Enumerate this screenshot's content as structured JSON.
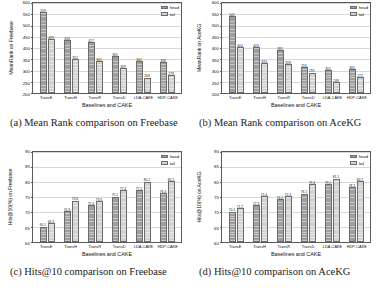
{
  "figure": {
    "shared": {
      "xlabel": "Baselines and CAKE",
      "categories": [
        "TransE",
        "TransH",
        "TransR",
        "TransD",
        "LDA-CAKE",
        "HDP-CAKE"
      ],
      "legend": [
        "head",
        "tail"
      ]
    },
    "subfigures": [
      {
        "tag": "(a)",
        "caption": "(a) Mean Rank comparison on Freebase",
        "caption_label": "(a)",
        "caption_text": "Mean Rank comparison on Freebase"
      },
      {
        "tag": "(b)",
        "caption": "(b) Mean Rank comparison on AceKG",
        "caption_label": "(b)",
        "caption_text": "Mean Rank comparison on AceKG"
      },
      {
        "tag": "(c)",
        "caption": "(c) Hits@10 comparison on Freebase",
        "caption_label": "(c)",
        "caption_text": "Hits@10 comparison on Freebase"
      },
      {
        "tag": "(d)",
        "caption": "(d) Hits@10 comparison on AceKG",
        "caption_label": "(d)",
        "caption_text": "Hits@10 comparison on AceKG"
      }
    ]
  },
  "chart_data": [
    {
      "type": "bar",
      "panel": "a",
      "title": "",
      "xlabel": "Baselines and CAKE",
      "ylabel": "MeanRank on Freebase",
      "categories": [
        "TransE",
        "TransH",
        "TransR",
        "TransD",
        "LDA-CAKE",
        "HDP-CAKE"
      ],
      "series": [
        {
          "name": "head",
          "values": [
            559,
            434,
            427,
            365,
            341,
            338
          ]
        },
        {
          "name": "tail",
          "values": [
            439,
            352,
            341,
            309,
            268,
            278
          ]
        }
      ],
      "ylim": [
        200,
        600
      ],
      "yticks": [
        200,
        250,
        300,
        350,
        400,
        450,
        500,
        550,
        600
      ],
      "grid": true,
      "legend_position": "top-right"
    },
    {
      "type": "bar",
      "panel": "b",
      "title": "",
      "xlabel": "Baselines and CAKE",
      "ylabel": "MeanRank on AceKG",
      "categories": [
        "TransE",
        "TransH",
        "TransR",
        "TransD",
        "LDA-CAKE",
        "HDP-CAKE"
      ],
      "series": [
        {
          "name": "head",
          "values": [
            541,
            403,
            392,
            316,
            301,
            305
          ]
        },
        {
          "name": "tail",
          "values": [
            404,
            333,
            328,
            291,
            248,
            272
          ]
        }
      ],
      "ylim": [
        200,
        600
      ],
      "yticks": [
        200,
        250,
        300,
        350,
        400,
        450,
        500,
        550,
        600
      ],
      "grid": true,
      "legend_position": "top-right"
    },
    {
      "type": "bar",
      "panel": "c",
      "title": "",
      "xlabel": "Baselines and CAKE",
      "ylabel": "Hits@10(%) on Freebase",
      "categories": [
        "TransE",
        "TransH",
        "TransR",
        "TransD",
        "LDA-CAKE",
        "HDP-CAKE"
      ],
      "series": [
        {
          "name": "head",
          "values": [
            65.1,
            70.3,
            72.4,
            75.1,
            77.2,
            76.4
          ]
        },
        {
          "name": "tail",
          "values": [
            66.3,
            73.8,
            73.6,
            77.4,
            80.1,
            80.2
          ]
        }
      ],
      "ylim": [
        60,
        90
      ],
      "yticks": [
        60,
        65,
        70,
        75,
        80,
        85,
        90
      ],
      "grid": true,
      "legend_position": "top-right"
    },
    {
      "type": "bar",
      "panel": "d",
      "title": "",
      "xlabel": "Baselines and CAKE",
      "ylabel": "Hits@10(%) on AceKG",
      "categories": [
        "TransE",
        "TransH",
        "TransR",
        "TransD",
        "LDA-CAKE",
        "HDP-CAKE"
      ],
      "series": [
        {
          "name": "head",
          "values": [
            70.1,
            72.3,
            74.2,
            76.1,
            79.2,
            78.3
          ]
        },
        {
          "name": "tail",
          "values": [
            71.2,
            75.4,
            75.3,
            79.4,
            81.1,
            80.2
          ]
        }
      ],
      "ylim": [
        60,
        90
      ],
      "yticks": [
        60,
        65,
        70,
        75,
        80,
        85,
        90
      ],
      "grid": true,
      "legend_position": "top-right"
    }
  ]
}
